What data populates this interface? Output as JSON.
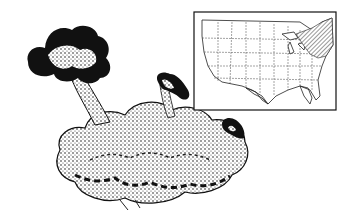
{
  "figure": {
    "colors": {
      "ink": "#111111",
      "paper": "#ffffff",
      "shade": "#555555"
    }
  },
  "map": {
    "region": "contiguous United States",
    "highlighted_range": "northeastern states and Great Lakes region (shaded)"
  }
}
